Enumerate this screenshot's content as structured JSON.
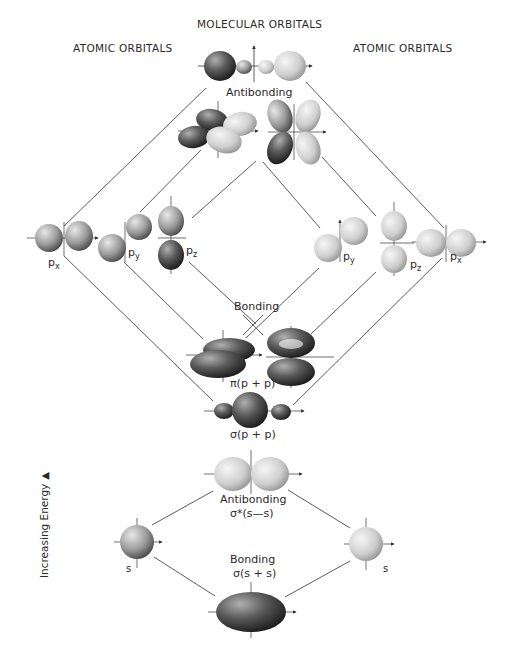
{
  "headers": {
    "center": "MOLECULAR ORBITALS",
    "left": "ATOMIC ORBITALS",
    "right": "ATOMIC ORBITALS"
  },
  "axis": {
    "label": "Increasing Energy",
    "arrow": "▲"
  },
  "p_section": {
    "antibonding_label": "Antibonding",
    "bonding_label": "Bonding",
    "pi_label": "π(p + p)",
    "sigma_label": "σ(p + p)",
    "left_atom": [
      {
        "label": "p",
        "sub": "x"
      },
      {
        "label": "p",
        "sub": "y"
      },
      {
        "label": "p",
        "sub": "z"
      }
    ],
    "right_atom": [
      {
        "label": "p",
        "sub": "y"
      },
      {
        "label": "p",
        "sub": "z"
      },
      {
        "label": "p",
        "sub": "x"
      }
    ]
  },
  "s_section": {
    "antibonding_label": "Antibonding",
    "antibonding_formula": "σ*(s—s)",
    "bonding_label": "Bonding",
    "bonding_formula": "σ(s + s)",
    "left_atom_label": "s",
    "right_atom_label": "s"
  },
  "colors": {
    "line": "#4a4a4a",
    "dark_lobe": "#2e2e2e",
    "light_lobe": "#d8d8d8",
    "mid_lobe": "#8a8a8a"
  }
}
